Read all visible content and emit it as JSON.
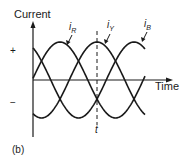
{
  "figure": {
    "y_axis_label": "Current",
    "x_axis_label": "Time",
    "plus_sign": "+",
    "minus_sign": "−",
    "time_marker_label": "t",
    "caption": "(b)",
    "curve_labels": {
      "iR": {
        "main": "i",
        "sub": "R"
      },
      "iY": {
        "main": "i",
        "sub": "Y"
      },
      "iB": {
        "main": "i",
        "sub": "B"
      }
    },
    "line_color": "#1a1a1a"
  },
  "chart_data": {
    "type": "line",
    "xlabel": "Time",
    "ylabel": "Current",
    "phase_shift_deg": 120,
    "series": [
      {
        "name": "i_R",
        "amplitude": 1,
        "phase_peak_deg": -120
      },
      {
        "name": "i_Y",
        "amplitude": 1,
        "phase_peak_deg": 0
      },
      {
        "name": "i_B",
        "amplitude": 1,
        "phase_peak_deg": 120
      }
    ],
    "marker": {
      "label": "t",
      "at": "peak of i_Y",
      "style": "dashed"
    },
    "y_ticks": [
      "+",
      "−"
    ],
    "grid": false,
    "legend": "inline labels with leader arrows"
  }
}
